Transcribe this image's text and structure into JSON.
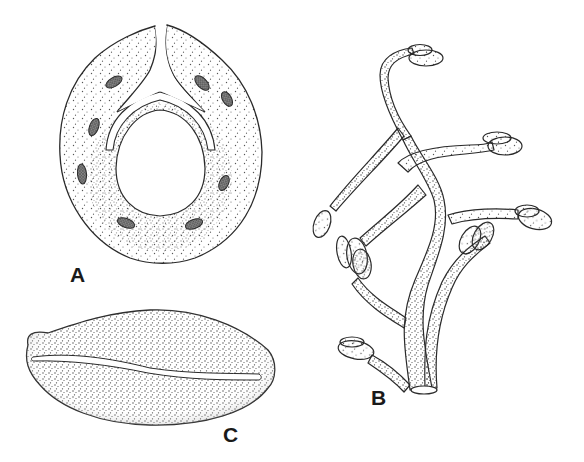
{
  "figure": {
    "type": "scientific stippled line illustration",
    "panels": [
      {
        "id": "A",
        "label": "A",
        "description": "cross-section of ovoid structure with apical cleft, central cavity, U-shaped canal and eight dark oval inclusions"
      },
      {
        "id": "B",
        "label": "B",
        "description": "branched tubular structure with ovoid terminal bodies"
      },
      {
        "id": "C",
        "label": "C",
        "description": "lens-shaped body with longitudinal slit"
      }
    ]
  },
  "colors": {
    "ink": "#2a2a2a",
    "stipple": "#4a4a4a",
    "spot": "#555555",
    "background": "#ffffff"
  }
}
